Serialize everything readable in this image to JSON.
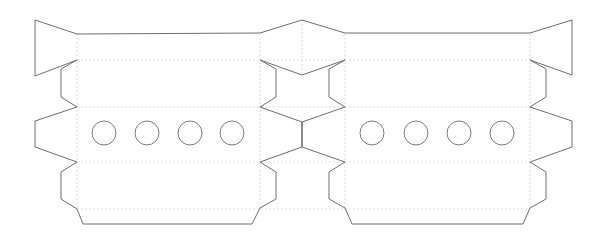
{
  "diagram": {
    "type": "papercraft-template",
    "colors": {
      "background": "#ffffff",
      "cut_line": "#6f6f6f",
      "fold_line": "#dcdcdc",
      "hole_outline": "#7a7a7a"
    },
    "panels": [
      {
        "id": "left-panel",
        "hole_count": 4,
        "holes": [
          {
            "cx": 104,
            "cy": 133,
            "r": 12
          },
          {
            "cx": 147,
            "cy": 133,
            "r": 12
          },
          {
            "cx": 190,
            "cy": 133,
            "r": 12
          },
          {
            "cx": 232,
            "cy": 133,
            "r": 12
          }
        ]
      },
      {
        "id": "right-panel",
        "hole_count": 4,
        "holes": [
          {
            "cx": 372,
            "cy": 133,
            "r": 12
          },
          {
            "cx": 416,
            "cy": 133,
            "r": 12
          },
          {
            "cx": 459,
            "cy": 133,
            "r": 12
          },
          {
            "cx": 502,
            "cy": 133,
            "r": 12
          }
        ]
      }
    ],
    "outline_path": "M77,34 L35,20 L35,76 L77,60 L61,69 L61,97 L77,107 L35,121 L35,147 L77,162 L61,172 L61,199 L77,209 L83,224 L252,224 L260,208 L276,199 L276,172 L260,162 L302,147 L345,162 L329,172 L329,199 L345,208 L352,224 L523,224 L530,208 L546,199 L546,172 L530,162 L572,147 L572,121 L530,107 L546,97 L546,69 L530,60 L572,75 L572,20 L530,33 L345,33 L302,20 L260,33 Z",
    "inner_cut_path": "M260,60 L302,75 L345,60 L329,69 L329,97 L345,107 L302,122 L260,107 L276,97 L276,69 Z",
    "center_seam": {
      "x": 302,
      "y1": 122,
      "y2": 147
    },
    "fold_lines": {
      "vertical": [
        {
          "x": 77,
          "y1": 34,
          "y2": 210
        },
        {
          "x": 260,
          "y1": 34,
          "y2": 210
        },
        {
          "x": 302,
          "y1": 20,
          "y2": 75
        },
        {
          "x": 345,
          "y1": 34,
          "y2": 210
        },
        {
          "x": 530,
          "y1": 34,
          "y2": 210
        }
      ],
      "horizontal": [
        {
          "y": 60,
          "x1": 77,
          "x2": 530
        },
        {
          "y": 107,
          "x1": 77,
          "x2": 530
        },
        {
          "y": 162,
          "x1": 77,
          "x2": 530
        },
        {
          "y": 209,
          "x1": 77,
          "x2": 530
        }
      ]
    }
  }
}
